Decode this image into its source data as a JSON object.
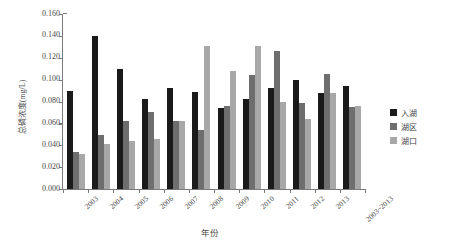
{
  "chart_data": {
    "type": "bar",
    "title": "",
    "xlabel": "年份",
    "ylabel": "总磷浓度(mg/L)",
    "ylim": [
      0.0,
      0.16
    ],
    "ytick_labels": [
      "0.160",
      "0.140",
      "0.120",
      "0.100",
      "0.080",
      "0.060",
      "0.040",
      "0.020",
      "0.000"
    ],
    "ytick_values": [
      0.16,
      0.14,
      0.12,
      0.1,
      0.08,
      0.06,
      0.04,
      0.02,
      0.0
    ],
    "grid": false,
    "legend_position": "right",
    "categories": [
      "2003",
      "2004",
      "2005",
      "2006",
      "2007",
      "2008",
      "2009",
      "2010",
      "2011",
      "2012",
      "2013",
      "2003~2013"
    ],
    "series": [
      {
        "name": "入湖",
        "color": "#1a1a1a",
        "values": [
          0.09,
          0.14,
          0.11,
          0.082,
          0.092,
          0.089,
          0.074,
          0.082,
          0.092,
          0.1,
          0.088,
          0.094
        ]
      },
      {
        "name": "湖区",
        "color": "#6e6e6e",
        "values": [
          0.034,
          0.049,
          0.062,
          0.07,
          0.062,
          0.054,
          0.076,
          0.104,
          0.126,
          0.079,
          0.105,
          0.075
        ]
      },
      {
        "name": "湖口",
        "color": "#a8a8a8",
        "values": [
          0.032,
          0.041,
          0.044,
          0.046,
          0.062,
          0.131,
          0.108,
          0.131,
          0.08,
          0.064,
          0.088,
          0.076
        ]
      }
    ]
  }
}
